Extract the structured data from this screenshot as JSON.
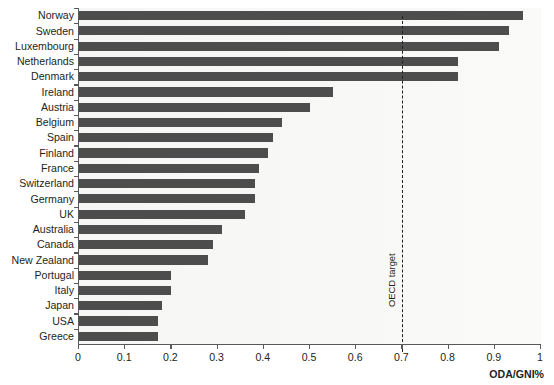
{
  "chart_data": {
    "type": "bar",
    "orientation": "horizontal",
    "title": "",
    "subtitle": "",
    "xlabel": "ODA/GNI%",
    "ylabel": "",
    "xlim": [
      0,
      1
    ],
    "ylim": null,
    "grid": false,
    "legend": null,
    "xticks": [
      "0",
      "0.1",
      "0.2",
      "0.3",
      "0.4",
      "0.5",
      "0.6",
      "0.7",
      "0.8",
      "0.9",
      "1"
    ],
    "xtick_values": [
      0,
      0.1,
      0.2,
      0.3,
      0.4,
      0.5,
      0.6,
      0.7,
      0.8,
      0.9,
      1
    ],
    "categories": [
      "Norway",
      "Sweden",
      "Luxembourg",
      "Netherlands",
      "Denmark",
      "Ireland",
      "Austria",
      "Belgium",
      "Spain",
      "Finland",
      "France",
      "Switzerland",
      "Germany",
      "UK",
      "Australia",
      "Canada",
      "New Zealand",
      "Portugal",
      "Italy",
      "Japan",
      "USA",
      "Greece"
    ],
    "values": [
      0.96,
      0.93,
      0.91,
      0.82,
      0.82,
      0.55,
      0.5,
      0.44,
      0.42,
      0.41,
      0.39,
      0.38,
      0.38,
      0.36,
      0.31,
      0.29,
      0.28,
      0.2,
      0.2,
      0.18,
      0.17,
      0.17
    ],
    "bar_color": "#4d4d4d",
    "plot_background": "#f7f7f5",
    "axis_color": "#58595b",
    "annotations": [
      {
        "name": "oecd-target",
        "label": "OECD target",
        "value": 0.7,
        "style": "dashed-vertical-line",
        "color": "#231f20"
      }
    ]
  }
}
